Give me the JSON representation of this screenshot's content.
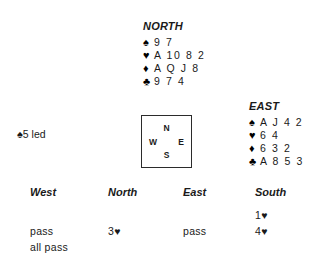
{
  "hands": {
    "north": {
      "label": "NORTH",
      "suits": [
        {
          "name": "spades",
          "symbol": "♠",
          "cards": "9 7"
        },
        {
          "name": "hearts",
          "symbol": "♥",
          "cards": "A 10 8 2"
        },
        {
          "name": "diamonds",
          "symbol": "♦",
          "cards": "A Q J 8"
        },
        {
          "name": "clubs",
          "symbol": "♣",
          "cards": "9 7 4"
        }
      ]
    },
    "east": {
      "label": "EAST",
      "suits": [
        {
          "name": "spades",
          "symbol": "♠",
          "cards": "A J 4 2"
        },
        {
          "name": "hearts",
          "symbol": "♥",
          "cards": "6 4"
        },
        {
          "name": "diamonds",
          "symbol": "♦",
          "cards": "6 3 2"
        },
        {
          "name": "clubs",
          "symbol": "♣",
          "cards": "A 8 5 3"
        }
      ]
    }
  },
  "compass": {
    "north": "N",
    "west": "W",
    "east": "E",
    "south": "S"
  },
  "opening_lead": {
    "symbol": "♠",
    "text": "5 led"
  },
  "auction": {
    "headers": [
      "West",
      "North",
      "East",
      "South"
    ],
    "rows": [
      [
        "",
        "",
        "",
        "1♥"
      ],
      [
        "pass",
        "3♥",
        "pass",
        "4♥"
      ],
      [
        "all pass",
        "",
        "",
        ""
      ]
    ]
  },
  "colors": {
    "text": "#1a1a1a",
    "background": "#ffffff",
    "box_border": "#2b2b2b"
  }
}
